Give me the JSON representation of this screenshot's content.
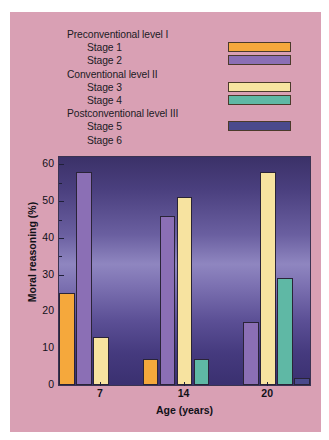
{
  "figure": {
    "background_color": "#d9a0b4",
    "plot_border_color": "#3a3352"
  },
  "legend": {
    "rows": [
      {
        "label": "Preconventional level I",
        "type": "heading",
        "swatch": null
      },
      {
        "label": "Stage 1",
        "type": "item",
        "swatch": "#f5a83c"
      },
      {
        "label": "Stage 2",
        "type": "item",
        "swatch": "#8b6fb5"
      },
      {
        "label": "Conventional level II",
        "type": "heading",
        "swatch": null
      },
      {
        "label": "Stage 3",
        "type": "item",
        "swatch": "#f7e3a0"
      },
      {
        "label": "Stage 4",
        "type": "item",
        "swatch": "#5fb8a5"
      },
      {
        "label": "Postconventional level III",
        "type": "heading",
        "swatch": null
      },
      {
        "label": "Stage 5",
        "type": "item",
        "swatch": "#4a4a8c"
      },
      {
        "label": "Stage 6",
        "type": "item",
        "swatch": null
      }
    ]
  },
  "chart_data": {
    "type": "bar",
    "title": "",
    "xlabel": "Age (years)",
    "ylabel": "Moral reasoning (%)",
    "categories": [
      "7",
      "14",
      "20"
    ],
    "ylim": [
      0,
      62
    ],
    "yticks": [
      0,
      10,
      20,
      30,
      40,
      50,
      60
    ],
    "ytick_labels": [
      "0",
      "10",
      "20",
      "30",
      "40",
      "50",
      "60"
    ],
    "yminor_step": 5,
    "grid": false,
    "legend_position": "above-plot",
    "series": [
      {
        "name": "Stage 1",
        "color": "#f5a83c",
        "values": [
          25,
          7,
          0
        ]
      },
      {
        "name": "Stage 2",
        "color": "#8b6fb5",
        "values": [
          58,
          46,
          17
        ]
      },
      {
        "name": "Stage 3",
        "color": "#f7e3a0",
        "values": [
          13,
          51,
          58
        ]
      },
      {
        "name": "Stage 4",
        "color": "#5fb8a5",
        "values": [
          0,
          7,
          29
        ]
      },
      {
        "name": "Stage 5",
        "color": "#4a4a8c",
        "values": [
          0,
          0,
          2
        ]
      },
      {
        "name": "Stage 6",
        "color": "#4a4a8c",
        "values": [
          0,
          0,
          0
        ]
      }
    ]
  }
}
